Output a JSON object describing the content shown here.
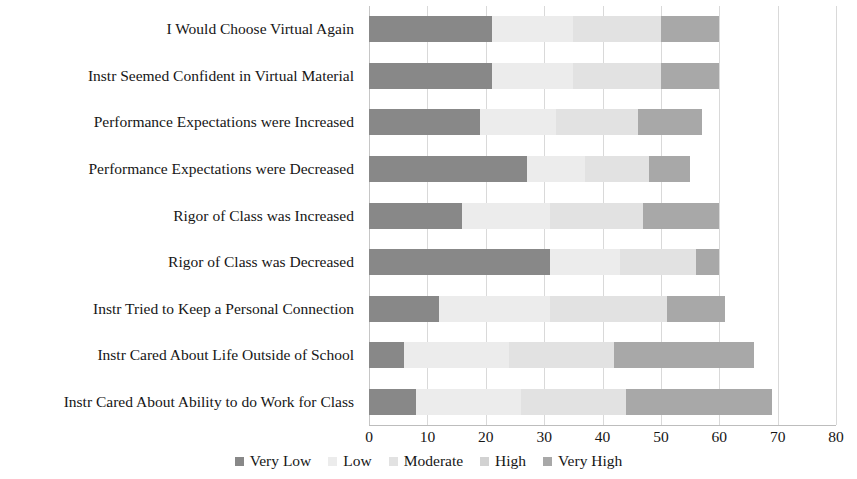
{
  "chart_data": {
    "type": "bar",
    "subtype": "stacked-horizontal-bar",
    "title": "",
    "xlabel": "",
    "ylabel": "",
    "xlim": [
      0,
      80
    ],
    "xticks": [
      0,
      10,
      20,
      30,
      40,
      50,
      60,
      70,
      80
    ],
    "grid": true,
    "grid_axis": "x",
    "legend_position": "bottom",
    "orientation": "horizontal",
    "categories": [
      "I Would Choose Virtual Again",
      "Instr Seemed Confident in Virtual Material",
      "Performance Expectations were Increased",
      "Performance Expectations were Decreased",
      "Rigor of Class was Increased",
      "Rigor of Class was Decreased",
      "Instr Tried to Keep a Personal Connection",
      "Instr Cared About Life Outside of School",
      "Instr Cared About Ability to do Work for Class"
    ],
    "series": [
      {
        "name": "Very Low",
        "color": "#888888",
        "values": [
          21,
          21,
          19,
          27,
          16,
          31,
          12,
          6,
          8
        ]
      },
      {
        "name": "Low",
        "color": "#ececec",
        "values": [
          14,
          14,
          13,
          10,
          15,
          12,
          19,
          18,
          18
        ]
      },
      {
        "name": "Moderate",
        "color": "#e2e2e2",
        "values": [
          15,
          15,
          14,
          11,
          16,
          13,
          20,
          18,
          18
        ]
      },
      {
        "name": "High",
        "color": "#d2d2d2",
        "values": [
          0,
          0,
          0,
          0,
          0,
          0,
          0,
          0,
          0
        ]
      },
      {
        "name": "Very High",
        "color": "#a8a8a8",
        "values": [
          10,
          10,
          11,
          7,
          13,
          4,
          10,
          24,
          25
        ]
      }
    ],
    "bar_totals": [
      60,
      60,
      57,
      55,
      60,
      60,
      61,
      66,
      69
    ],
    "segment_boundaries": [
      [
        0,
        21,
        35,
        50,
        50,
        60
      ],
      [
        0,
        21,
        35,
        50,
        50,
        60
      ],
      [
        0,
        19,
        32,
        46,
        46,
        57
      ],
      [
        0,
        27,
        37,
        48,
        48,
        55
      ],
      [
        0,
        16,
        31,
        47,
        47,
        60
      ],
      [
        0,
        31,
        43,
        56,
        56,
        60
      ],
      [
        0,
        12,
        31,
        51,
        51,
        61
      ],
      [
        0,
        6,
        24,
        42,
        42,
        66
      ],
      [
        0,
        8,
        26,
        44,
        44,
        69
      ]
    ]
  },
  "legend": {
    "items": [
      {
        "label": "Very Low",
        "color": "#888888"
      },
      {
        "label": "Low",
        "color": "#ececec"
      },
      {
        "label": "Moderate",
        "color": "#e2e2e2"
      },
      {
        "label": "High",
        "color": "#d2d2d2"
      },
      {
        "label": "Very High",
        "color": "#a8a8a8"
      }
    ]
  }
}
